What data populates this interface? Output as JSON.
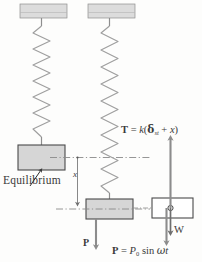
{
  "figure": {
    "colors": {
      "block_fill": "#d6d6d6",
      "block_stroke": "#4a4a4a",
      "ceiling_fill": "#d9d9d9",
      "spring_stroke": "#9a9a9a",
      "arrow_fill": "#8c8c8c",
      "dashdot_stroke": "#8a8a8a",
      "fbd_fill": "#ffffff",
      "text": "#3a3a3a"
    }
  },
  "labels": {
    "equilibrium": "Equilibrium",
    "displacement": "x",
    "force_mid": "P",
    "weight": "W"
  },
  "equations": {
    "tension": {
      "lhs": "T",
      "eq": "=",
      "stiffness": "k",
      "open": "(",
      "delta": "δ",
      "delta_sub": "st",
      "plus": "+",
      "x": "x",
      "close": ")",
      "plain": "T = k(δst + x)"
    },
    "forcing": {
      "lhs": "P",
      "eq": "=",
      "amplitude": "P",
      "amplitude_sub": "0",
      "sin": "sin",
      "omega": "ω",
      "t": "t",
      "plain": "P = P0 sin ωt"
    }
  },
  "panels": [
    {
      "name": "equilibrium-position",
      "has_ceiling": true,
      "has_spring": true,
      "has_block": true
    },
    {
      "name": "displaced-position",
      "has_ceiling": true,
      "has_spring": true,
      "has_block": true,
      "has_force": true
    },
    {
      "name": "free-body-diagram",
      "has_body": true,
      "has_tension": true,
      "has_weight": true,
      "has_forcing": true
    }
  ]
}
